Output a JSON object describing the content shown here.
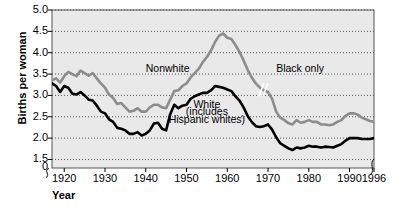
{
  "chart_data": {
    "type": "line",
    "title": "",
    "xlabel": "Year",
    "ylabel": "Births per woman",
    "xlim": [
      1917,
      1996
    ],
    "ylim": [
      1.3,
      5.0
    ],
    "grid": true,
    "y_axis_break": true,
    "x_axis_break": true,
    "legend_position": "inline-annotations",
    "yticks": [
      "5.0",
      "4.5",
      "4.0",
      "3.5",
      "3.0",
      "2.5",
      "2.0",
      "1.5",
      "0"
    ],
    "ytick_values": [
      5.0,
      4.5,
      4.0,
      3.5,
      3.0,
      2.5,
      2.0,
      1.5,
      1.3
    ],
    "xticks": [
      "1920",
      "1930",
      "1940",
      "1950",
      "1960",
      "1970",
      "1980",
      "1990",
      "1996"
    ],
    "xtick_values": [
      1920,
      1930,
      1940,
      1950,
      1960,
      1970,
      1980,
      1990,
      1996
    ],
    "annotations": [
      {
        "text": "Nonwhite",
        "x": 1940,
        "y": 3.62
      },
      {
        "text": "Black only",
        "x": 1972,
        "y": 3.63
      },
      {
        "text": "White",
        "x": 1955,
        "y": 2.78
      },
      {
        "text": "(includes",
        "x": 1955,
        "y": 2.6
      },
      {
        "text": "Hispanic whites)",
        "x": 1955,
        "y": 2.42
      }
    ],
    "series": [
      {
        "name": "Nonwhite / Black only",
        "color": "#8c8c8c",
        "style": "solid",
        "linewidth": 2.6,
        "break_at": 1969,
        "break_label_before": "Nonwhite",
        "break_label_after": "Black only",
        "x": [
          1917,
          1918,
          1919,
          1920,
          1921,
          1922,
          1923,
          1924,
          1925,
          1926,
          1927,
          1928,
          1929,
          1930,
          1931,
          1932,
          1933,
          1934,
          1935,
          1936,
          1937,
          1938,
          1939,
          1940,
          1941,
          1942,
          1943,
          1944,
          1945,
          1946,
          1947,
          1948,
          1949,
          1950,
          1951,
          1952,
          1953,
          1954,
          1955,
          1956,
          1957,
          1958,
          1959,
          1960,
          1961,
          1962,
          1963,
          1964,
          1965,
          1966,
          1967,
          1968,
          1969,
          1970,
          1971,
          1972,
          1973,
          1974,
          1975,
          1976,
          1977,
          1978,
          1979,
          1980,
          1981,
          1982,
          1983,
          1984,
          1985,
          1986,
          1987,
          1988,
          1989,
          1990,
          1991,
          1992,
          1993,
          1994,
          1995,
          1996
        ],
        "y": [
          3.35,
          3.4,
          3.3,
          3.45,
          3.55,
          3.5,
          3.45,
          3.58,
          3.52,
          3.46,
          3.52,
          3.4,
          3.28,
          3.18,
          3.02,
          2.94,
          2.8,
          2.82,
          2.72,
          2.62,
          2.64,
          2.7,
          2.62,
          2.62,
          2.72,
          2.78,
          2.78,
          2.72,
          2.7,
          2.9,
          3.1,
          3.12,
          3.22,
          3.28,
          3.42,
          3.52,
          3.62,
          3.78,
          3.9,
          4.05,
          4.25,
          4.4,
          4.45,
          4.35,
          4.32,
          4.18,
          4.02,
          3.82,
          3.6,
          3.42,
          3.28,
          3.18,
          3.12,
          3.08,
          2.92,
          2.62,
          2.48,
          2.42,
          2.35,
          2.32,
          2.42,
          2.36,
          2.38,
          2.42,
          2.38,
          2.38,
          2.32,
          2.32,
          2.3,
          2.32,
          2.38,
          2.42,
          2.52,
          2.58,
          2.58,
          2.55,
          2.48,
          2.44,
          2.4,
          2.38
        ]
      },
      {
        "name": "White (includes Hispanic whites)",
        "color": "#000000",
        "style": "solid",
        "linewidth": 2.6,
        "x": [
          1917,
          1918,
          1919,
          1920,
          1921,
          1922,
          1923,
          1924,
          1925,
          1926,
          1927,
          1928,
          1929,
          1930,
          1931,
          1932,
          1933,
          1934,
          1935,
          1936,
          1937,
          1938,
          1939,
          1940,
          1941,
          1942,
          1943,
          1944,
          1945,
          1946,
          1947,
          1948,
          1949,
          1950,
          1951,
          1952,
          1953,
          1954,
          1955,
          1956,
          1957,
          1958,
          1959,
          1960,
          1961,
          1962,
          1963,
          1964,
          1965,
          1966,
          1967,
          1968,
          1969,
          1970,
          1971,
          1972,
          1973,
          1974,
          1975,
          1976,
          1977,
          1978,
          1979,
          1980,
          1981,
          1982,
          1983,
          1984,
          1985,
          1986,
          1987,
          1988,
          1989,
          1990,
          1991,
          1992,
          1993,
          1994,
          1995,
          1996
        ],
        "y": [
          3.28,
          3.22,
          3.08,
          3.22,
          3.18,
          3.04,
          3.02,
          3.08,
          3.0,
          2.9,
          2.88,
          2.76,
          2.62,
          2.58,
          2.44,
          2.38,
          2.24,
          2.22,
          2.18,
          2.1,
          2.1,
          2.14,
          2.06,
          2.1,
          2.18,
          2.34,
          2.36,
          2.22,
          2.18,
          2.56,
          2.78,
          2.7,
          2.76,
          2.78,
          2.92,
          2.98,
          3.02,
          3.06,
          3.06,
          3.12,
          3.22,
          3.2,
          3.18,
          3.14,
          3.1,
          2.98,
          2.88,
          2.72,
          2.52,
          2.38,
          2.28,
          2.26,
          2.28,
          2.32,
          2.2,
          2.02,
          1.88,
          1.82,
          1.76,
          1.72,
          1.78,
          1.76,
          1.78,
          1.82,
          1.8,
          1.8,
          1.78,
          1.8,
          1.79,
          1.78,
          1.82,
          1.86,
          1.94,
          2.0,
          2.0,
          2.0,
          1.98,
          1.98,
          1.98,
          2.0
        ]
      }
    ]
  },
  "axes": {
    "plot_bg": "#e9e9e9",
    "grid_color": "#444444",
    "border_color": "#555555"
  }
}
